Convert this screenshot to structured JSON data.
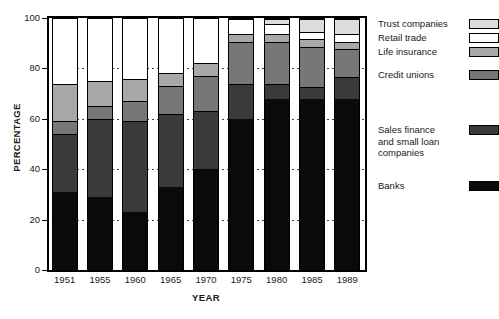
{
  "chart_data": {
    "type": "bar",
    "subtype": "stacked-bar",
    "title": "",
    "xlabel": "YEAR",
    "ylabel": "PERCENTAGE",
    "ylim": [
      0,
      100
    ],
    "yticks": [
      0,
      20,
      40,
      60,
      80,
      100
    ],
    "grid": "horizontal-dotted",
    "legend_position": "right",
    "categories": [
      "1951",
      "1955",
      "1960",
      "1965",
      "1970",
      "1975",
      "1980",
      "1985",
      "1989"
    ],
    "series": [
      {
        "name": "Banks",
        "color": "#0a0a0a",
        "values": [
          31,
          29,
          23,
          33,
          40,
          60,
          68,
          68,
          68
        ]
      },
      {
        "name": "Sales finance and small loan companies",
        "color": "#3a3a3a",
        "values": [
          23,
          31,
          36,
          29,
          23,
          14,
          6,
          5,
          9
        ]
      },
      {
        "name": "Credit unions",
        "color": "#777777",
        "values": [
          5,
          5,
          8,
          11,
          14,
          17,
          17,
          16,
          11
        ]
      },
      {
        "name": "Life insurance",
        "color": "#a8a8a8",
        "values": [
          15,
          10,
          9,
          5,
          5,
          3,
          3,
          3,
          3
        ]
      },
      {
        "name": "Retail trade",
        "color": "#ffffff",
        "values": [
          0,
          0,
          0,
          0,
          0,
          6,
          4,
          3,
          3
        ]
      },
      {
        "name": "Trust companies",
        "color": "#dcdcdc",
        "values": [
          0,
          0,
          0,
          0,
          0,
          0,
          2,
          5,
          6
        ]
      }
    ],
    "bar_totals": [
      74,
      75,
      76,
      78,
      82,
      100,
      100,
      100,
      100
    ]
  },
  "axes": {
    "y_title": "PERCENTAGE",
    "x_title": "YEAR",
    "y_tick_labels": [
      "100",
      "80",
      "60",
      "40",
      "20",
      "0"
    ],
    "x_tick_labels": [
      "1951",
      "1955",
      "1960",
      "1965",
      "1970",
      "1975",
      "1980",
      "1985",
      "1989"
    ]
  },
  "legend": {
    "entries": [
      {
        "label": "Trust companies",
        "color": "#dcdcdc"
      },
      {
        "label": "Retail trade",
        "color": "#ffffff"
      },
      {
        "label": "Life insurance",
        "color": "#a8a8a8"
      },
      {
        "label": "Credit unions",
        "color": "#777777"
      },
      {
        "label": "Sales finance\nand small loan\ncompanies",
        "color": "#3a3a3a"
      },
      {
        "label": "Banks",
        "color": "#0a0a0a"
      }
    ]
  }
}
